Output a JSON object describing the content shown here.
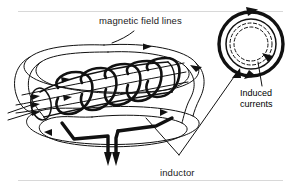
{
  "figure": {
    "title_label": "magnetic field lines",
    "inductor_label": "inductor",
    "induced_line1": "Induced",
    "induced_line2": "currents",
    "ink_color": "#111111",
    "background_color": "#ffffff",
    "rule_color": "#d8d8d8"
  },
  "solenoid": {
    "coil_turns": 5,
    "lead_wires": 2
  },
  "ring": {
    "solid_rings": 2,
    "dashed_rings": 2,
    "current_direction": "clockwise"
  }
}
